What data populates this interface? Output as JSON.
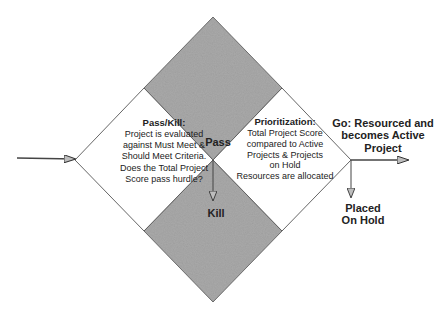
{
  "diagram": {
    "colors": {
      "background": "#ffffff",
      "gray_fill": "#a9a9a9",
      "white_fill": "#ffffff",
      "stroke": "#444444",
      "text": "#222222"
    },
    "pass_kill": {
      "title": "Pass/Kill:",
      "lines": [
        "Project is evaluated",
        "against Must Meet &",
        "Should Meet Criteria.",
        "Does the Total Project",
        "Score pass hurdle?"
      ]
    },
    "prioritization": {
      "title": "Prioritization:",
      "lines": [
        "Total Project Score",
        "compared to Active",
        "Projects & Projects",
        "on Hold",
        "Resources are allocated"
      ]
    },
    "pass_label": "Pass",
    "kill_label": "Kill",
    "go_label": {
      "lines": [
        "Go: Resourced and",
        "becomes Active",
        "Project"
      ]
    },
    "hold_label": {
      "lines": [
        "Placed",
        "On Hold"
      ]
    }
  }
}
